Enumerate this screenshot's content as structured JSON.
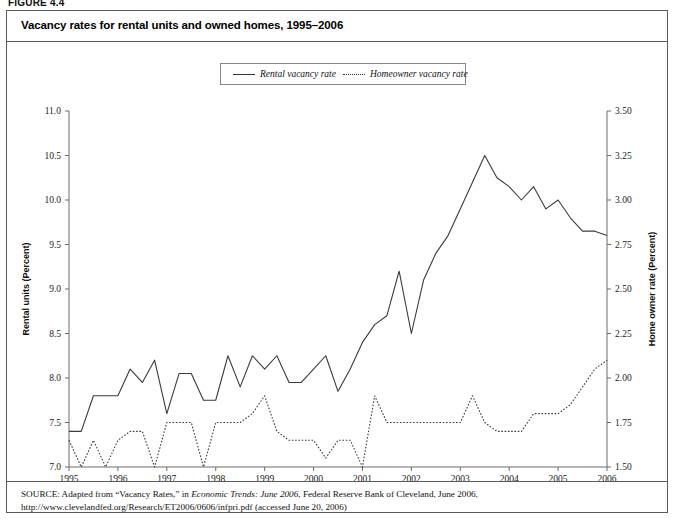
{
  "figure": {
    "label": "FIGURE 4.4",
    "title": "Vacancy rates for rental units and owned homes, 1995–2006"
  },
  "legend": {
    "position": "top-center",
    "items": [
      {
        "label": "Rental vacancy rate",
        "style": "solid",
        "axis": "left"
      },
      {
        "label": "Homeowner vacancy rate",
        "style": "dotted",
        "axis": "right"
      }
    ]
  },
  "axes": {
    "left": {
      "title": "Rental units (Percent)",
      "ticks": [
        "7.0",
        "7.5",
        "8.0",
        "8.5",
        "9.0",
        "9.5",
        "10.0",
        "10.5",
        "11.0"
      ],
      "min": 7.0,
      "max": 11.0,
      "step": 0.5
    },
    "right": {
      "title": "Home owner rate (Percent)",
      "ticks": [
        "1.50",
        "1.75",
        "2.00",
        "2.25",
        "2.50",
        "2.75",
        "3.00",
        "3.25",
        "3.50"
      ],
      "min": 1.5,
      "max": 3.5,
      "step": 0.25
    },
    "bottom": {
      "title": "",
      "ticks": [
        "1995",
        "1996",
        "1997",
        "1998",
        "1999",
        "2000",
        "2001",
        "2002",
        "2003",
        "2004",
        "2005",
        "2006"
      ],
      "min": 1995.0,
      "max": 2006.0
    }
  },
  "source": {
    "label": "SOURCE:",
    "text_before_italic": " Adapted from “Vacancy Rates,” in ",
    "italic": "Economic Trends: June 2006",
    "text_after_italic": ", Federal Reserve Bank of Cleveland, June 2006, http://www.clevelandfed.org/Research/ET2006/0606/infpri.pdf (accessed June 20, 2006)"
  },
  "colors": {
    "line": "#3b3b3b",
    "axis": "#6a6a6a",
    "frame": "#5a5a5a",
    "text": "#111111",
    "background": "#ffffff"
  },
  "chart_data": {
    "type": "line",
    "title": "Vacancy rates for rental units and owned homes, 1995–2006",
    "xlabel": "",
    "ylabel": "Rental units (Percent)",
    "y2label": "Home owner rate (Percent)",
    "xlim": [
      1995.0,
      2006.0
    ],
    "ylim": [
      7.0,
      11.0
    ],
    "y2lim": [
      1.5,
      3.5
    ],
    "grid": false,
    "legend_position": "top-center",
    "x": [
      1995.0,
      1995.25,
      1995.5,
      1995.75,
      1996.0,
      1996.25,
      1996.5,
      1996.75,
      1997.0,
      1997.25,
      1997.5,
      1997.75,
      1998.0,
      1998.25,
      1998.5,
      1998.75,
      1999.0,
      1999.25,
      1999.5,
      1999.75,
      2000.0,
      2000.25,
      2000.5,
      2000.75,
      2001.0,
      2001.25,
      2001.5,
      2001.75,
      2002.0,
      2002.25,
      2002.5,
      2002.75,
      2003.0,
      2003.25,
      2003.5,
      2003.75,
      2004.0,
      2004.25,
      2004.5,
      2004.75,
      2005.0,
      2005.25,
      2005.5,
      2005.75,
      2006.0
    ],
    "x_labels": [
      "1995 Q1",
      "1995 Q2",
      "1995 Q3",
      "1995 Q4",
      "1996 Q1",
      "1996 Q2",
      "1996 Q3",
      "1996 Q4",
      "1997 Q1",
      "1997 Q2",
      "1997 Q3",
      "1997 Q4",
      "1998 Q1",
      "1998 Q2",
      "1998 Q3",
      "1998 Q4",
      "1999 Q1",
      "1999 Q2",
      "1999 Q3",
      "1999 Q4",
      "2000 Q1",
      "2000 Q2",
      "2000 Q3",
      "2000 Q4",
      "2001 Q1",
      "2001 Q2",
      "2001 Q3",
      "2001 Q4",
      "2002 Q1",
      "2002 Q2",
      "2002 Q3",
      "2002 Q4",
      "2003 Q1",
      "2003 Q2",
      "2003 Q3",
      "2003 Q4",
      "2004 Q1",
      "2004 Q2",
      "2004 Q3",
      "2004 Q4",
      "2005 Q1",
      "2005 Q2",
      "2005 Q3",
      "2005 Q4",
      "2006 Q1"
    ],
    "series": [
      {
        "name": "Rental vacancy rate",
        "axis": "left",
        "style": "solid",
        "unit": "percent",
        "values": [
          7.4,
          7.4,
          7.8,
          7.8,
          7.8,
          8.1,
          7.95,
          8.2,
          7.6,
          8.05,
          8.05,
          7.75,
          7.75,
          8.25,
          7.9,
          8.25,
          8.1,
          8.25,
          7.95,
          7.95,
          8.1,
          8.25,
          7.85,
          8.1,
          8.4,
          8.6,
          8.7,
          9.2,
          8.5,
          9.1,
          9.4,
          9.6,
          9.9,
          10.2,
          10.5,
          10.25,
          10.15,
          10.0,
          10.15,
          9.9,
          10.0,
          9.8,
          9.65,
          9.65,
          9.6
        ]
      },
      {
        "name": "Homeowner vacancy rate",
        "axis": "right",
        "style": "dotted",
        "unit": "percent",
        "values": [
          1.65,
          1.5,
          1.65,
          1.5,
          1.65,
          1.7,
          1.7,
          1.5,
          1.75,
          1.75,
          1.75,
          1.5,
          1.75,
          1.75,
          1.75,
          1.8,
          1.9,
          1.7,
          1.65,
          1.65,
          1.65,
          1.55,
          1.65,
          1.65,
          1.5,
          1.9,
          1.75,
          1.75,
          1.75,
          1.75,
          1.75,
          1.75,
          1.75,
          1.9,
          1.75,
          1.7,
          1.7,
          1.7,
          1.8,
          1.8,
          1.8,
          1.85,
          1.95,
          2.05,
          2.1
        ]
      }
    ]
  }
}
